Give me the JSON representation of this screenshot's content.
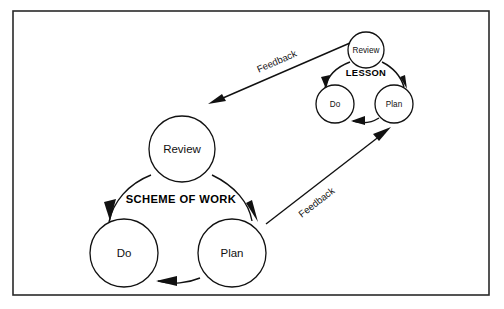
{
  "diagram": {
    "background_color": "#ffffff",
    "line_color": "#111111",
    "frame_color": "#2a2a2a"
  },
  "cycles": [
    {
      "id": "scheme-of-work",
      "title": "SCHEME OF WORK",
      "nodes": [
        {
          "id": "scheme-review",
          "label": "Review"
        },
        {
          "id": "scheme-do",
          "label": "Do"
        },
        {
          "id": "scheme-plan",
          "label": "Plan"
        }
      ],
      "flow": [
        "Review",
        "Plan",
        "Do",
        "Review"
      ]
    },
    {
      "id": "lesson",
      "title": "LESSON",
      "nodes": [
        {
          "id": "lesson-review",
          "label": "Review"
        },
        {
          "id": "lesson-do",
          "label": "Do"
        },
        {
          "id": "lesson-plan",
          "label": "Plan"
        }
      ],
      "flow": [
        "Review",
        "Plan",
        "Do",
        "Review"
      ]
    }
  ],
  "connectors": [
    {
      "id": "feedback-lesson-to-scheme",
      "label": "Feedback",
      "from": "LESSON Review",
      "to": "SCHEME OF WORK Review"
    },
    {
      "id": "feedback-scheme-to-lesson",
      "label": "Feedback",
      "from": "SCHEME OF WORK Plan",
      "to": "LESSON Plan"
    }
  ]
}
